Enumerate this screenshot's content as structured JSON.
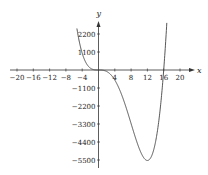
{
  "chart_data": {
    "type": "line",
    "title": "",
    "xlabel": "x",
    "ylabel": "y",
    "xlim": [
      -22,
      23
    ],
    "ylim": [
      -6000,
      2900
    ],
    "x_ticks": [
      -20,
      -16,
      -12,
      -8,
      -4,
      4,
      8,
      12,
      16,
      20
    ],
    "x_tick_labels": [
      "−20",
      "−16",
      "−12",
      "−8",
      "−4",
      "4",
      "8",
      "12",
      "16",
      "20"
    ],
    "y_ticks": [
      2200,
      1100,
      -1100,
      -2200,
      -3300,
      -4400,
      -5500
    ],
    "y_tick_labels": [
      "2200",
      "1100",
      "−1100",
      "−2200",
      "−3300",
      "−4400",
      "−5500"
    ],
    "grid": false,
    "legend": null,
    "series": [
      {
        "name": "f(x) = 0.8 x^3 (x - 16)",
        "x": [
          -5.3,
          -5,
          -4,
          -3,
          -2,
          -1,
          0,
          1,
          2,
          3,
          4,
          5,
          6,
          7,
          8,
          9,
          10,
          11,
          12,
          13,
          14,
          15,
          16,
          16.5,
          17.1
        ],
        "y": [
          2810,
          2100,
          1024,
          410,
          115,
          14,
          0,
          -12,
          -90,
          -281,
          -614,
          -1100,
          -1728,
          -2470,
          -3277,
          -4082,
          -4800,
          -5324,
          -5530,
          -5273,
          -4390,
          -2700,
          0,
          1797,
          4300
        ]
      }
    ],
    "annotations": {
      "min_point": {
        "x": 12,
        "y": -5530
      },
      "roots": [
        0,
        16
      ]
    },
    "style": {
      "axis_color": "#333333",
      "curve_color": "#444444",
      "background": "#ffffff"
    }
  }
}
